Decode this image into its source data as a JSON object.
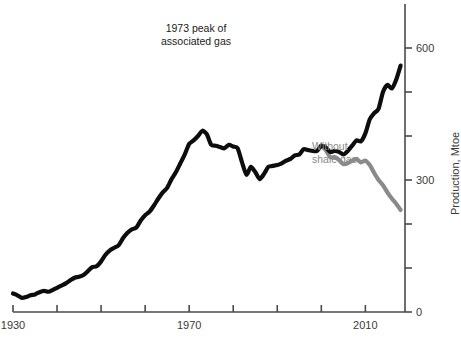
{
  "chart_data": {
    "type": "line",
    "title": "",
    "xlabel": "",
    "ylabel": "Production, Mtoe",
    "xlim": [
      1930,
      2019
    ],
    "ylim": [
      0,
      700
    ],
    "grid": false,
    "legend": "none",
    "x_ticks": [
      1930,
      1940,
      1950,
      1960,
      1970,
      1980,
      1990,
      2000,
      2010
    ],
    "x_tick_labels": [
      "1930",
      "",
      "",
      "",
      "1970",
      "",
      "",
      "",
      "2010"
    ],
    "y_ticks": [
      0,
      100,
      200,
      300,
      400,
      500,
      600
    ],
    "y_tick_labels": [
      "0",
      "",
      "",
      "300",
      "",
      "",
      "600"
    ],
    "annotations": [
      {
        "name": "peak-annotation",
        "text": "1973 peak of\nassociated gas",
        "color": "#1a1a1a",
        "x_px": 196,
        "y_px": 22
      },
      {
        "name": "without-shale-gas-annotation",
        "text": "Without\nshale gas",
        "color": "#8a8a8a",
        "x_px": 312,
        "y_px": 140
      }
    ],
    "series": [
      {
        "name": "US natural gas production",
        "color": "#0d0d0d",
        "x": [
          1930,
          1931,
          1932,
          1933,
          1934,
          1935,
          1936,
          1937,
          1938,
          1939,
          1940,
          1941,
          1942,
          1943,
          1944,
          1945,
          1946,
          1947,
          1948,
          1949,
          1950,
          1951,
          1952,
          1953,
          1954,
          1955,
          1956,
          1957,
          1958,
          1959,
          1960,
          1961,
          1962,
          1963,
          1964,
          1965,
          1966,
          1967,
          1968,
          1969,
          1970,
          1971,
          1972,
          1973,
          1974,
          1975,
          1976,
          1977,
          1978,
          1979,
          1980,
          1981,
          1982,
          1983,
          1984,
          1985,
          1986,
          1987,
          1988,
          1989,
          1990,
          1991,
          1992,
          1993,
          1994,
          1995,
          1996,
          1997,
          1998,
          1999,
          2000,
          2001,
          2002,
          2003,
          2004,
          2005,
          2006,
          2007,
          2008,
          2009,
          2010,
          2011,
          2012,
          2013,
          2014,
          2015,
          2016,
          2017,
          2018
        ],
        "values": [
          42,
          38,
          32,
          34,
          38,
          40,
          45,
          48,
          46,
          50,
          55,
          60,
          65,
          72,
          78,
          80,
          84,
          93,
          102,
          104,
          115,
          130,
          140,
          146,
          152,
          168,
          180,
          188,
          192,
          208,
          220,
          228,
          242,
          258,
          272,
          282,
          302,
          318,
          338,
          358,
          382,
          390,
          400,
          412,
          404,
          380,
          378,
          375,
          372,
          380,
          376,
          372,
          340,
          312,
          330,
          318,
          302,
          314,
          330,
          332,
          334,
          338,
          344,
          348,
          356,
          358,
          370,
          368,
          366,
          366,
          378,
          374,
          364,
          366,
          364,
          358,
          366,
          378,
          390,
          388,
          406,
          438,
          452,
          462,
          500,
          516,
          508,
          528,
          560
        ]
      },
      {
        "name": "Without shale gas",
        "color": "#8a8a8a",
        "x": [
          2000,
          2001,
          2002,
          2003,
          2004,
          2005,
          2006,
          2007,
          2008,
          2009,
          2010,
          2011,
          2012,
          2013,
          2014,
          2015,
          2016,
          2017,
          2018
        ],
        "values": [
          378,
          368,
          352,
          352,
          346,
          336,
          338,
          344,
          348,
          340,
          344,
          334,
          316,
          300,
          288,
          272,
          258,
          246,
          232
        ]
      }
    ]
  },
  "axes": {
    "y_axis_title": "Production, Mtoe",
    "x_axis_title": ""
  }
}
